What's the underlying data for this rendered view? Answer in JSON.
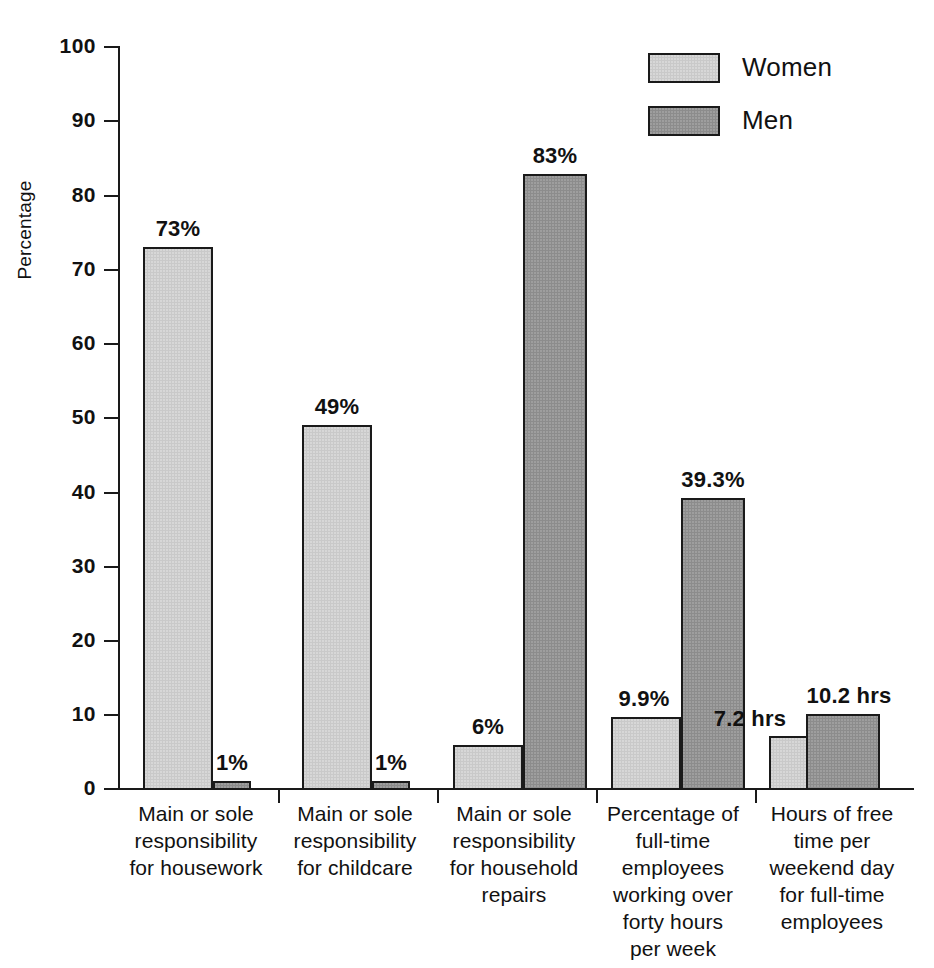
{
  "chart_data": {
    "type": "bar",
    "title": "",
    "xlabel": "",
    "ylabel": "Percentage",
    "ylim": [
      0,
      100
    ],
    "yticks": [
      0,
      10,
      20,
      30,
      40,
      50,
      60,
      70,
      80,
      90,
      100
    ],
    "grid": false,
    "legend_position": "top-right",
    "categories": [
      "Main or sole responsibility for housework",
      "Main or sole responsibility for childcare",
      "Main or sole responsibility for household repairs",
      "Percentage of full-time employees working over forty hours per week",
      "Hours of free time per weekend day for full-time employees"
    ],
    "category_lines": [
      [
        "Main or sole",
        "responsibility",
        "for housework"
      ],
      [
        "Main or sole",
        "responsibility",
        "for childcare"
      ],
      [
        "Main or sole",
        "responsibility",
        "for household",
        "repairs"
      ],
      [
        "Percentage of",
        "full-time",
        "employees",
        "working over",
        "forty hours",
        "per week"
      ],
      [
        "Hours of free",
        "time per",
        "weekend day",
        "for full-time",
        "employees"
      ]
    ],
    "series": [
      {
        "name": "Women",
        "color": "#c9c9c9",
        "values": [
          73,
          49,
          6,
          9.9,
          7.2
        ],
        "labels": [
          "73%",
          "49%",
          "6%",
          "9.9%",
          "7.2 hrs"
        ]
      },
      {
        "name": "Men",
        "color": "#8c8c8c",
        "values": [
          1,
          1,
          83,
          39.3,
          10.2
        ],
        "labels": [
          "1%",
          "1%",
          "83%",
          "39.3%",
          "10.2 hrs"
        ]
      }
    ]
  },
  "axis": {
    "y_label": "Percentage",
    "y_tick_labels": [
      "100",
      "90",
      "80",
      "70",
      "60",
      "50",
      "40",
      "30",
      "20",
      "10",
      "0"
    ]
  },
  "legend": {
    "items": [
      {
        "label": "Women",
        "color": "#c9c9c9"
      },
      {
        "label": "Men",
        "color": "#8c8c8c"
      }
    ]
  },
  "values": {
    "g1_women": "73%",
    "g1_men": "1%",
    "g2_women": "49%",
    "g2_men": "1%",
    "g3_women": "6%",
    "g3_men": "83%",
    "g4_women": "9.9%",
    "g4_men": "39.3%",
    "g5_women": "7.2 hrs",
    "g5_men": "10.2 hrs"
  },
  "group_labels": {
    "g1": "Main or sole\nresponsibility\nfor housework",
    "g2": "Main or sole\nresponsibility\nfor childcare",
    "g3": "Main or sole\nresponsibility\nfor household\nrepairs",
    "g4": "Percentage of\nfull-time\nemployees\nworking over\nforty hours\nper week",
    "g5": "Hours of free\ntime per\nweekend day\nfor full-time\nemployees"
  }
}
